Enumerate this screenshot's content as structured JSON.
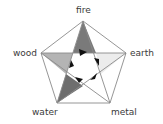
{
  "diagram": {
    "type": "wu-xing five elements pentagram",
    "elements": [
      {
        "name": "fire",
        "label": "fire",
        "vertex": [
          83,
          21
        ]
      },
      {
        "name": "earth",
        "label": "earth",
        "vertex": [
          126,
          53
        ]
      },
      {
        "name": "metal",
        "label": "metal",
        "vertex": [
          110,
          103
        ]
      },
      {
        "name": "water",
        "label": "water",
        "vertex": [
          57,
          103
        ]
      },
      {
        "name": "wood",
        "label": "wood",
        "vertex": [
          41,
          53
        ]
      }
    ],
    "colors": {
      "line": "#8a8a8a",
      "fire_fill": "#7a7a7a",
      "wood_fill": "#b4b4b4",
      "earth_fill": "#ececec",
      "water_fill": "#6e6e6e",
      "arrow": "#111111",
      "label": "#3a3a3a"
    },
    "center_cycle": {
      "arrow_count": 5,
      "direction": "clockwise"
    }
  }
}
